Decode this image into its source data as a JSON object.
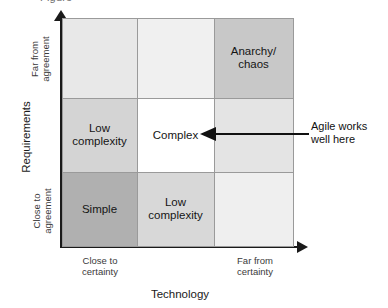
{
  "figure": {
    "clipped_top_caption": "Figure",
    "y_axis_title": "Requirements",
    "x_axis_title": "Technology",
    "y_axis_high_label": "Far from\nagreement",
    "y_axis_low_label": "Close to\nagreement",
    "x_axis_low_label": "Close to\ncertainty",
    "x_axis_high_label": "Far from\ncertainty"
  },
  "callout": {
    "text": "Agile works\nwell here",
    "points_to": "Complex"
  },
  "chart_data": {
    "type": "heatmap",
    "xlabel": "Technology",
    "ylabel": "Requirements",
    "x_categories": [
      "Close to certainty",
      "Middle",
      "Far from certainty"
    ],
    "y_categories": [
      "Close to agreement",
      "Middle",
      "Far from agreement"
    ],
    "grid": true,
    "legend": "none",
    "cells": [
      {
        "row": 0,
        "col": 0,
        "label": "",
        "fill": "#e8e8e8"
      },
      {
        "row": 0,
        "col": 1,
        "label": "",
        "fill": "#f0f0f0"
      },
      {
        "row": 0,
        "col": 2,
        "label": "Anarchy/\nchaos",
        "fill": "#c8c8c8"
      },
      {
        "row": 1,
        "col": 0,
        "label": "Low\ncomplexity",
        "fill": "#d4d4d4"
      },
      {
        "row": 1,
        "col": 1,
        "label": "Complex",
        "fill": "#ffffff"
      },
      {
        "row": 1,
        "col": 2,
        "label": "",
        "fill": "#e4e4e4"
      },
      {
        "row": 2,
        "col": 0,
        "label": "Simple",
        "fill": "#b0b0b0"
      },
      {
        "row": 2,
        "col": 1,
        "label": "Low\ncomplexity",
        "fill": "#d8d8d8"
      },
      {
        "row": 2,
        "col": 2,
        "label": "",
        "fill": "#efefef"
      }
    ],
    "annotations": [
      {
        "text": "Agile works well here",
        "target": "Complex"
      }
    ]
  },
  "colors": {
    "axis": "#1a1a1a",
    "grid_line": "#9a9a9a",
    "text": "#151515",
    "background": "#ffffff"
  }
}
